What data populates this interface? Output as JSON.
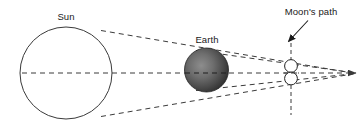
{
  "diagram": {
    "background_color": "#ffffff",
    "line_color": "#3a3a3a",
    "text_color": "#1a1a1a",
    "labels": {
      "sun": "Sun",
      "earth": "Earth",
      "moons_path": "Moon's path"
    },
    "bodies": {
      "sun": {
        "name": "Sun",
        "cx": 66,
        "cy": 73,
        "r": 46,
        "fill": "#ffffff",
        "stroke": "#3a3a3a"
      },
      "earth": {
        "name": "Earth",
        "cx": 206.5,
        "cy": 70,
        "r": 22,
        "fill_light": "#8a8a8a",
        "fill_dark": "#2b2b2b",
        "stroke": "#2b2b2b"
      },
      "moon_upper": {
        "name": "Moon position upper",
        "cx": 291,
        "cy": 66,
        "r": 6.5,
        "fill": "#ffffff",
        "stroke": "#2b2b2b"
      },
      "moon_lower": {
        "name": "Moon position lower",
        "cx": 291,
        "cy": 78,
        "r": 6.5,
        "fill": "#ffffff",
        "stroke": "#2b2b2b"
      }
    },
    "lines": {
      "axis": {
        "name": "central axis",
        "x1": 22,
        "y1": 73,
        "x2": 357,
        "y2": 73,
        "dash": "5,4"
      },
      "umbra_upper": {
        "name": "upper tangent shadow line",
        "x1": 101,
        "y1": 30,
        "x2": 355,
        "y2": 74,
        "dash": "5,4"
      },
      "umbra_lower": {
        "name": "lower tangent shadow line",
        "x1": 101,
        "y1": 117,
        "x2": 355,
        "y2": 74,
        "dash": "5,4"
      },
      "penumbra_upper": {
        "name": "upper cone edge from earth",
        "x1": 197,
        "y1": 92,
        "x2": 355,
        "y2": 72,
        "dash": "5,4"
      },
      "penumbra_lower": {
        "name": "lower cone edge from earth",
        "x1": 197,
        "y1": 50,
        "x2": 355,
        "y2": 74,
        "dash": "5,4"
      },
      "moons_path_line": {
        "name": "moons path vertical dashed line",
        "x1": 291,
        "y1": 36,
        "x2": 291,
        "y2": 115,
        "dash": "4,3"
      }
    },
    "annotations": {
      "pointer_arrow": {
        "name": "moons path pointer arrow",
        "x1": 308,
        "y1": 21,
        "x2": 288,
        "y2": 42
      },
      "axis_arrowhead": {
        "name": "axis direction arrowhead",
        "x": 357,
        "y": 73
      }
    },
    "label_positions": {
      "sun": {
        "x": 66,
        "y": 20
      },
      "earth": {
        "x": 207,
        "y": 43
      },
      "moons_path": {
        "x": 311,
        "y": 15
      }
    }
  }
}
